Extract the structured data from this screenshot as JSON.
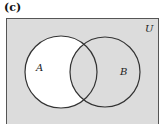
{
  "panel": {
    "label": "(c)"
  },
  "diagram": {
    "type": "venn",
    "universe_label": "U",
    "sets": [
      {
        "name": "A",
        "label": "A",
        "cx": 61,
        "cy": 72,
        "r": 36
      },
      {
        "name": "B",
        "label": "B",
        "cx": 105,
        "cy": 72,
        "r": 35
      }
    ],
    "shaded_region": "complement of (A minus B)",
    "unshaded_region": "A minus B",
    "colors": {
      "shade": "#dcdcdc",
      "unshaded": "#ffffff",
      "stroke": "#333333"
    }
  }
}
